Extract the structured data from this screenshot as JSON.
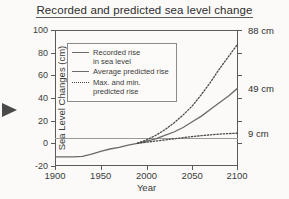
{
  "chart_data": {
    "type": "line",
    "title": "Recorded and predicted sea level change",
    "xlabel": "Year",
    "ylabel": "Sea Level Changes (cm)",
    "xlim": [
      1900,
      2100
    ],
    "ylim": [
      -20,
      100
    ],
    "xticks": [
      "1900",
      "1950",
      "2000",
      "2050",
      "2100"
    ],
    "xtick_values": [
      1900,
      1950,
      2000,
      2050,
      2100
    ],
    "yticks": [
      "100",
      "80",
      "60",
      "40",
      "20",
      "0",
      "-20"
    ],
    "ytick_values": [
      100,
      80,
      60,
      40,
      20,
      0,
      -20
    ],
    "grid": false,
    "legend_position": "upper-left-inside",
    "series": [
      {
        "name": "Recorded rise in sea level",
        "style": "solid",
        "x": [
          1900,
          1910,
          1920,
          1930,
          1940,
          1950,
          1960,
          1970,
          1980,
          1990
        ],
        "values": [
          -12,
          -12,
          -12,
          -11.5,
          -9.5,
          -7,
          -5,
          -3.5,
          -1.5,
          0
        ]
      },
      {
        "name": "Average predicted rise",
        "style": "solid",
        "x": [
          1990,
          2000,
          2010,
          2020,
          2030,
          2040,
          2050,
          2060,
          2070,
          2080,
          2090,
          2100
        ],
        "values": [
          0,
          2,
          4,
          7,
          10,
          14,
          19,
          24,
          30,
          36,
          42,
          49
        ],
        "endpoint_label": "49 cm"
      },
      {
        "name": "Max. predicted rise",
        "style": "dotted",
        "x": [
          1990,
          2000,
          2010,
          2020,
          2030,
          2040,
          2050,
          2060,
          2070,
          2080,
          2090,
          2100
        ],
        "values": [
          0,
          3,
          7,
          12,
          18,
          25,
          33,
          43,
          54,
          66,
          77,
          88
        ],
        "endpoint_label": "88 cm"
      },
      {
        "name": "Min. predicted rise",
        "style": "dotted",
        "x": [
          1990,
          2000,
          2010,
          2020,
          2030,
          2040,
          2050,
          2060,
          2070,
          2080,
          2090,
          2100
        ],
        "values": [
          0,
          1,
          2,
          3,
          4,
          5,
          6,
          6.8,
          7.5,
          8.2,
          8.6,
          9
        ],
        "endpoint_label": "9 cm"
      }
    ],
    "annotations": [
      {
        "text": "88 cm",
        "value": 88
      },
      {
        "text": "49 cm",
        "value": 49
      },
      {
        "text": "9 cm",
        "value": 9
      }
    ]
  },
  "legend": {
    "items": [
      {
        "style": "solid",
        "line1": "Recorded rise",
        "line2": "in sea level"
      },
      {
        "style": "solid",
        "line1": "Average predicted rise",
        "line2": ""
      },
      {
        "style": "dotted",
        "line1": "Max. and min.",
        "line2": "predicted rise"
      }
    ]
  },
  "colors": {
    "background": "#fbfaf8",
    "axis": "#5a5a5a",
    "recorded_line": "#6a6a6a",
    "average_line": "#6a6a6a",
    "bounds_line": "#4a4a4a",
    "text": "#3a3a3a"
  }
}
